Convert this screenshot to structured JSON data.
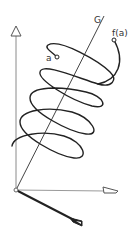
{
  "diagram": {
    "type": "helix around axis",
    "labels": {
      "axis_line": "G",
      "start_point": "a",
      "end_point": "f(a)"
    },
    "colors": {
      "background": "#ffffff",
      "curve": "#222222",
      "axes": "#888888",
      "thick_axis": "#222222"
    },
    "elements": {
      "vertical_axis": "coordinate axis with open triangle arrowhead",
      "horizontal_axis": "coordinate axis with open triangle arrowhead",
      "depth_axis": "bold coordinate axis with arrowhead",
      "origin": "small open circle",
      "line_G": "straight line through origin",
      "helix": "spiral curve winding around line G from a to f(a)"
    }
  }
}
